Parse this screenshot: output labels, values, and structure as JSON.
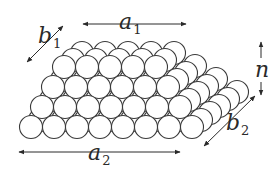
{
  "diagram": {
    "colors": {
      "stroke": "#3a3a3a",
      "fill": "#ffffff",
      "text": "#2a2a2a"
    },
    "sphere_radius": 11.5,
    "front_face": {
      "description": "Front face rows from bottom to top",
      "rows": [
        {
          "count": 8,
          "x0": 31,
          "y": 127
        },
        {
          "count": 7,
          "x0": 42,
          "y": 107
        },
        {
          "count": 6,
          "x0": 53,
          "y": 87
        },
        {
          "count": 5,
          "x0": 64,
          "y": 67
        }
      ],
      "spacing": 23
    },
    "back_rows": {
      "description": "Back-layer offsets along depth (up-right)",
      "depth_dx": 9,
      "depth_dy": -7,
      "top_back_layers": 2
    },
    "labels": {
      "a1": {
        "main": "a",
        "sub": "1"
      },
      "a2": {
        "main": "a",
        "sub": "2"
      },
      "b1": {
        "main": "b",
        "sub": "1"
      },
      "b2": {
        "main": "b",
        "sub": "2"
      },
      "n": {
        "main": "n",
        "sub": ""
      }
    },
    "dimensions": [
      {
        "name": "a1",
        "meaning": "top row length",
        "arrow": "horizontal",
        "from": [
          83,
          24
        ],
        "to": [
          186,
          24
        ]
      },
      {
        "name": "a2",
        "meaning": "bottom row length",
        "arrow": "horizontal",
        "from": [
          19,
          152
        ],
        "to": [
          180,
          152
        ]
      },
      {
        "name": "b1",
        "meaning": "top depth",
        "arrow": "diagonal",
        "from": [
          27,
          62
        ],
        "to": [
          63,
          26
        ]
      },
      {
        "name": "b2",
        "meaning": "bottom depth",
        "arrow": "diagonal",
        "from": [
          204,
          146
        ],
        "to": [
          255,
          96
        ]
      },
      {
        "name": "n",
        "meaning": "number of layers (height)",
        "arrow": "vertical",
        "from": [
          261,
          42
        ],
        "to": [
          261,
          95
        ]
      }
    ]
  }
}
